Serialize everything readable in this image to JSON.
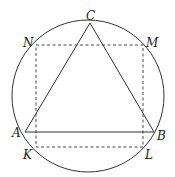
{
  "diagram": {
    "colors": {
      "stroke": "#333333",
      "background": "#ffffff"
    },
    "circle": {
      "cx": 88,
      "cy": 96,
      "r": 76
    },
    "points": {
      "C": {
        "label": "C",
        "x": 90,
        "y": 23
      },
      "N": {
        "label": "N",
        "x": 36,
        "y": 45
      },
      "M": {
        "label": "M",
        "x": 143,
        "y": 45
      },
      "A": {
        "label": "A",
        "x": 25,
        "y": 132
      },
      "B": {
        "label": "B",
        "x": 154,
        "y": 132
      },
      "K": {
        "label": "K",
        "x": 36,
        "y": 147
      },
      "L": {
        "label": "L",
        "x": 143,
        "y": 147
      }
    },
    "triangle": [
      "A",
      "B",
      "C"
    ],
    "dashed_rectangle": [
      "K",
      "L",
      "M",
      "N"
    ]
  }
}
